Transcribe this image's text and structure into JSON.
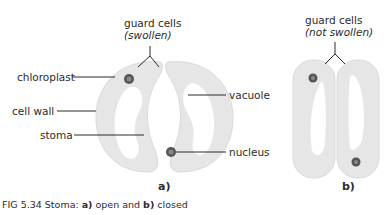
{
  "figure": {
    "panel_a": {
      "header_label": "guard cells",
      "header_sublabel": "(swollen)",
      "labels": {
        "chloroplast": "chloroplast",
        "cell_wall": "cell wall",
        "stoma": "stoma",
        "vacuole": "vacuole",
        "nucleus": "nucleus"
      },
      "panel_label": "a)"
    },
    "panel_b": {
      "header_label": "guard cells",
      "header_sublabel": "(not swollen)",
      "panel_label": "b)"
    },
    "caption": {
      "prefix": "FIG 5.34  Stoma: ",
      "a_label": "a)",
      "a_text": " open and ",
      "b_label": "b)",
      "b_text": " closed"
    },
    "colors": {
      "cell_fill": "#e6e6e6",
      "cell_edge": "#d6d6d6",
      "vacuole": "#ffffff",
      "nucleus": "#555555",
      "leader_line": "#2b2b2b"
    }
  }
}
